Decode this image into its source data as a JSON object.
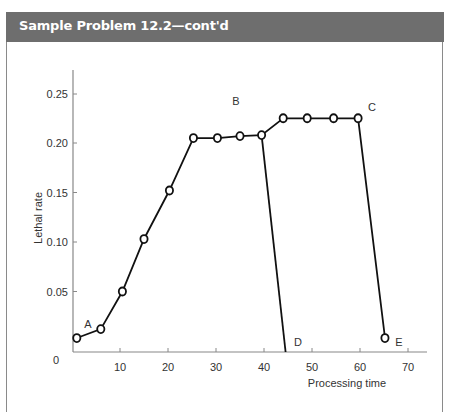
{
  "header": {
    "title": "Sample Problem 12.2—cont'd",
    "background_color": "#6e6e6e"
  },
  "chart_data": {
    "type": "line",
    "title": "",
    "xlabel": "Processing time",
    "ylabel": "Lethal rate",
    "xlim": [
      0,
      74
    ],
    "ylim": [
      0,
      0.28
    ],
    "grid": false,
    "x_ticks": [
      10,
      20,
      30,
      40,
      50,
      60,
      70
    ],
    "y_ticks": [
      0,
      0.05,
      0.1,
      0.15,
      0.2,
      0.25
    ],
    "y_tick_labels": [
      "0",
      "0.05",
      "0.10",
      "0.15",
      "0.20",
      "0.25"
    ],
    "series": [
      {
        "name": "Lethal rate curve",
        "marker": "open-circle",
        "points": [
          {
            "x": 1,
            "y": 0.003
          },
          {
            "x": 6,
            "y": 0.012
          },
          {
            "x": 10.5,
            "y": 0.05
          },
          {
            "x": 15,
            "y": 0.103
          },
          {
            "x": 20.3,
            "y": 0.152
          },
          {
            "x": 25.3,
            "y": 0.205
          },
          {
            "x": 30.3,
            "y": 0.205
          },
          {
            "x": 35,
            "y": 0.207
          },
          {
            "x": 39.5,
            "y": 0.208
          },
          {
            "x": 44,
            "y": 0.225
          },
          {
            "x": 49,
            "y": 0.225
          },
          {
            "x": 54.5,
            "y": 0.225
          },
          {
            "x": 59.6,
            "y": 0.225
          },
          {
            "x": 65.2,
            "y": 0.003
          }
        ]
      }
    ],
    "extra_segments": [
      {
        "from": {
          "x": 39.5,
          "y": 0.208
        },
        "to": {
          "x": 44.5,
          "y": 0.0
        },
        "note": "drop to D"
      }
    ],
    "annotations": [
      {
        "text": "A",
        "x": 4,
        "y": 0.035
      },
      {
        "text": "B",
        "x": 34,
        "y": 0.245
      },
      {
        "text": "C",
        "x": 62.5,
        "y": 0.235
      },
      {
        "text": "D",
        "x": 47.5,
        "y": 0.0
      },
      {
        "text": "E",
        "x": 68.5,
        "y": 0.0
      }
    ]
  }
}
